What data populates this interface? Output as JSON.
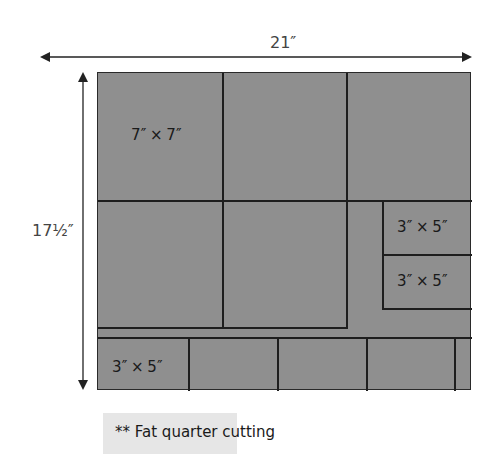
{
  "diagram": {
    "type": "cutting-layout",
    "width_label": "21″",
    "height_label": "17½″",
    "fabric_color": "#8f8f8f",
    "line_color": "#1e1e1e",
    "pieces": [
      {
        "id": "square-1",
        "label": "7″ × 7″"
      },
      {
        "id": "square-2",
        "label": ""
      },
      {
        "id": "square-3",
        "label": ""
      },
      {
        "id": "square-4",
        "label": ""
      },
      {
        "id": "square-5",
        "label": ""
      },
      {
        "id": "rect-right-1",
        "label": "3″ × 5″"
      },
      {
        "id": "rect-right-2",
        "label": "3″ × 5″"
      },
      {
        "id": "rect-bottom-1",
        "label": "3″ × 5″"
      },
      {
        "id": "rect-bottom-2",
        "label": ""
      },
      {
        "id": "rect-bottom-3",
        "label": ""
      },
      {
        "id": "rect-bottom-4",
        "label": ""
      },
      {
        "id": "rect-bottom-5",
        "label": ""
      }
    ]
  },
  "caption": {
    "text": "** Fat quarter cutting"
  }
}
